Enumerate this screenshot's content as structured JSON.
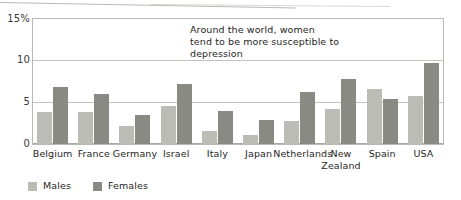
{
  "chart_data": {
    "type": "bar",
    "title": "",
    "subtitle": "",
    "xlabel": "",
    "ylabel": "",
    "ylim": [
      0,
      15
    ],
    "yticks": [
      0,
      5,
      10,
      15
    ],
    "ytick_labels": [
      "0",
      "5",
      "10",
      "15%"
    ],
    "grid": true,
    "legend_position": "bottom-left",
    "categories": [
      "Belgium",
      "France",
      "Germany",
      "Israel",
      "Italy",
      "Japan",
      "Netherlands",
      "New\nZealand",
      "Spain",
      "USA"
    ],
    "series": [
      {
        "name": "Males",
        "color": "#bcbcb7",
        "values": [
          3.8,
          3.8,
          2.1,
          4.5,
          1.6,
          1.1,
          2.7,
          4.2,
          6.5,
          5.7
        ]
      },
      {
        "name": "Females",
        "color": "#8a8a85",
        "values": [
          6.8,
          5.9,
          3.5,
          7.1,
          3.9,
          2.8,
          6.2,
          7.7,
          5.4,
          9.7
        ]
      }
    ],
    "annotations": [
      {
        "name": "chart-annotation",
        "text": "Around the world, women tend to be more susceptible to depression"
      }
    ]
  },
  "legend": {
    "items": [
      {
        "label": "Males",
        "swatch": "males"
      },
      {
        "label": "Females",
        "swatch": "females"
      }
    ]
  },
  "axis": {
    "y_labels": [
      "15%",
      "10",
      "5",
      "0"
    ]
  }
}
